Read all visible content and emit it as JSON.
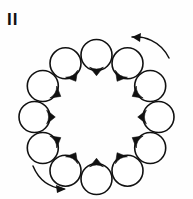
{
  "figure": {
    "panel_label": "II",
    "background_color": "#fefefe",
    "ink_color": "#111111",
    "width": 193,
    "height": 199
  },
  "ring": {
    "center_x": 96.5,
    "center_y": 117,
    "radius": 62,
    "cell_radius": 15.5,
    "count": 12,
    "cells": [
      {
        "id": "cell-01",
        "clock": "12:00",
        "cx": 96.5,
        "cy": 55.0,
        "r": 15.5,
        "tail_angle_deg": 90,
        "tail_label": "tail-down"
      },
      {
        "id": "cell-02",
        "clock": "1:00",
        "cx": 127.5,
        "cy": 63.3,
        "r": 15.5,
        "tail_angle_deg": 120,
        "tail_label": "tail-down-left"
      },
      {
        "id": "cell-03",
        "clock": "2:00",
        "cx": 150.2,
        "cy": 86.0,
        "r": 15.5,
        "tail_angle_deg": 150,
        "tail_label": "tail-left-down"
      },
      {
        "id": "cell-04",
        "clock": "3:00",
        "cx": 158.5,
        "cy": 117.0,
        "r": 15.5,
        "tail_angle_deg": 180,
        "tail_label": "tail-left"
      },
      {
        "id": "cell-05",
        "clock": "4:00",
        "cx": 150.2,
        "cy": 148.0,
        "r": 15.5,
        "tail_angle_deg": 210,
        "tail_label": "tail-up-left"
      },
      {
        "id": "cell-06",
        "clock": "5:00",
        "cx": 127.5,
        "cy": 170.7,
        "r": 15.5,
        "tail_angle_deg": 240,
        "tail_label": "tail-up-left"
      },
      {
        "id": "cell-07",
        "clock": "6:00",
        "cx": 96.5,
        "cy": 179.0,
        "r": 15.5,
        "tail_angle_deg": 270,
        "tail_label": "tail-up"
      },
      {
        "id": "cell-08",
        "clock": "7:00",
        "cx": 65.5,
        "cy": 170.7,
        "r": 15.5,
        "tail_angle_deg": 300,
        "tail_label": "tail-up-right"
      },
      {
        "id": "cell-09",
        "clock": "8:00",
        "cx": 42.8,
        "cy": 148.0,
        "r": 15.5,
        "tail_angle_deg": 330,
        "tail_label": "tail-right-down"
      },
      {
        "id": "cell-10",
        "clock": "9:00",
        "cx": 34.5,
        "cy": 117.0,
        "r": 15.5,
        "tail_angle_deg": 0,
        "tail_label": "tail-right"
      },
      {
        "id": "cell-11",
        "clock": "10:00",
        "cx": 42.8,
        "cy": 86.0,
        "r": 15.5,
        "tail_angle_deg": 30,
        "tail_label": "tail-right-down"
      },
      {
        "id": "cell-12",
        "clock": "11:00",
        "cx": 65.5,
        "cy": 63.3,
        "r": 15.5,
        "tail_angle_deg": 60,
        "tail_label": "tail-down-right"
      }
    ]
  },
  "arrows": [
    {
      "id": "arrow-top-right",
      "label": "rotation-arrow-top",
      "direction": "counterclockwise",
      "path": "M 169 58 C 160 40, 143 36, 132 37",
      "head_points": "132,37 141,33 140,42"
    },
    {
      "id": "arrow-bottom-left",
      "label": "rotation-arrow-bottom",
      "direction": "clockwise",
      "path": "M 33 166 C 40 183, 53 188, 64 189",
      "head_points": "66,189 56,185 57,193"
    }
  ],
  "chart_data": {
    "type": "diagram",
    "title": "II",
    "categories": [
      "12:00",
      "1:00",
      "2:00",
      "3:00",
      "4:00",
      "5:00",
      "6:00",
      "7:00",
      "8:00",
      "9:00",
      "10:00",
      "11:00"
    ],
    "values": [
      90,
      120,
      150,
      180,
      210,
      240,
      270,
      300,
      330,
      0,
      30,
      60
    ],
    "series": [
      {
        "name": "tail_angle_deg",
        "values": [
          90,
          120,
          150,
          180,
          210,
          240,
          270,
          300,
          330,
          0,
          30,
          60
        ]
      }
    ],
    "xlabel": "ring position (clock)",
    "ylabel": "tail orientation (degrees)",
    "ylim": [
      0,
      360
    ],
    "grid": false,
    "legend": "none",
    "annotations": [
      "II",
      "rotation-arrow-top",
      "rotation-arrow-bottom"
    ]
  }
}
